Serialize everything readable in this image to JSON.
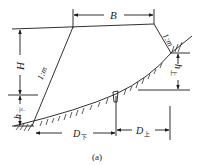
{
  "diagram": {
    "type": "embankment-cross-section",
    "labels": {
      "top_width": "B",
      "height": "H",
      "slope_left": "1:m",
      "slope_right": "1:m",
      "h_lower": "h",
      "h_lower_sub": "下",
      "h_upper": "h",
      "h_upper_sub": "上",
      "d_lower": "D",
      "d_lower_sub": "下",
      "d_upper": "D",
      "d_upper_sub": "上"
    },
    "caption": "(a)",
    "colors": {
      "line": "#1a1a1a",
      "background": "#ffffff"
    }
  }
}
